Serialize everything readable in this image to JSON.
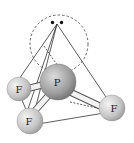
{
  "diagram": {
    "central_atom": {
      "label": "P",
      "color": "#9a9a9a"
    },
    "outer_atoms": [
      {
        "label": "F",
        "position": "left"
      },
      {
        "label": "F",
        "position": "bottom"
      },
      {
        "label": "F",
        "position": "right"
      }
    ],
    "lone_pair": {
      "dots": 2,
      "region": "dashed circle above P"
    },
    "colors": {
      "atom_fill": "#c8c8c8",
      "line": "#333333",
      "background": "#ffffff"
    }
  }
}
